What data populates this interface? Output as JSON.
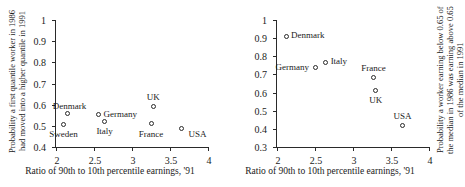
{
  "figure": {
    "background": "#ffffff",
    "ink": "#2a2a2a"
  },
  "chart_data": [
    {
      "id": "left",
      "type": "scatter",
      "title": "",
      "xlabel": "Ratio of 90th to 10th percentile earnings, '91",
      "ylabel_lines": [
        "Probability a first quantile worker in 1986",
        "had moved into a higher quantile in 1991"
      ],
      "xlim": [
        2,
        4
      ],
      "ylim": [
        0.4,
        1
      ],
      "xticks": [
        "2",
        "2.5",
        "3",
        "3.5",
        "4"
      ],
      "xtick_values": [
        2,
        2.5,
        3,
        3.5,
        4
      ],
      "yticks": [
        "0.4",
        "0.5",
        "0.6",
        "0.7",
        "0.8",
        "0.9",
        "1"
      ],
      "ytick_values": [
        0.4,
        0.5,
        0.6,
        0.7,
        0.8,
        0.9,
        1
      ],
      "grid": false,
      "legend": "none",
      "marker": "open-circle",
      "points": [
        {
          "label": "Denmark",
          "x": 2.15,
          "y": 0.558,
          "label_pos": "left-above"
        },
        {
          "label": "Sweden",
          "x": 2.1,
          "y": 0.508,
          "label_pos": "below"
        },
        {
          "label": "Germany",
          "x": 2.56,
          "y": 0.553,
          "label_pos": "right"
        },
        {
          "label": "Italy",
          "x": 2.64,
          "y": 0.522,
          "label_pos": "below"
        },
        {
          "label": "UK",
          "x": 3.28,
          "y": 0.592,
          "label_pos": "above"
        },
        {
          "label": "France",
          "x": 3.25,
          "y": 0.51,
          "label_pos": "below"
        },
        {
          "label": "USA",
          "x": 3.65,
          "y": 0.487,
          "label_pos": "right-below"
        }
      ]
    },
    {
      "id": "right",
      "type": "scatter",
      "title": "",
      "xlabel": "Ratio of 90th to 10th percentile earnings, '91",
      "ylabel_lines": [
        "Probability a worker earning below 0.65 of",
        "the median in 1986 was earning above 0.65",
        "of the median in 1991"
      ],
      "xlim": [
        2,
        4
      ],
      "ylim": [
        0.3,
        1
      ],
      "xticks": [
        "2",
        "2.5",
        "3",
        "3.5",
        "4"
      ],
      "xtick_values": [
        2,
        2.5,
        3,
        3.5,
        4
      ],
      "yticks": [
        "0.3",
        "0.4",
        "0.5",
        "0.6",
        "0.7",
        "0.8",
        "0.9",
        "1"
      ],
      "ytick_values": [
        0.3,
        0.4,
        0.5,
        0.6,
        0.7,
        0.8,
        0.9,
        1
      ],
      "grid": false,
      "legend": "none",
      "marker": "open-circle",
      "points": [
        {
          "label": "Denmark",
          "x": 2.12,
          "y": 0.91,
          "label_pos": "right"
        },
        {
          "label": "Germany",
          "x": 2.5,
          "y": 0.74,
          "label_pos": "left"
        },
        {
          "label": "Italy",
          "x": 2.64,
          "y": 0.768,
          "label_pos": "right"
        },
        {
          "label": "France",
          "x": 3.27,
          "y": 0.685,
          "label_pos": "above"
        },
        {
          "label": "UK",
          "x": 3.3,
          "y": 0.612,
          "label_pos": "below"
        },
        {
          "label": "USA",
          "x": 3.65,
          "y": 0.42,
          "label_pos": "above"
        }
      ]
    }
  ]
}
